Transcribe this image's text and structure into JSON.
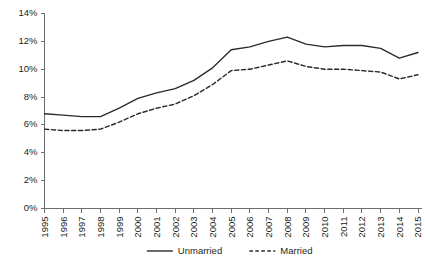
{
  "chart_data": {
    "type": "line",
    "title": "",
    "subtitle": "",
    "xlabel": "",
    "ylabel": "",
    "grid": false,
    "legend_position": "bottom-center",
    "ylim": [
      0,
      14
    ],
    "ytick_labels": [
      "0%",
      "2%",
      "4%",
      "6%",
      "8%",
      "10%",
      "12%",
      "14%"
    ],
    "ytick_values": [
      0,
      2,
      4,
      6,
      8,
      10,
      12,
      14
    ],
    "categories": [
      "1995",
      "1996",
      "1997",
      "1998",
      "1999",
      "2000",
      "2001",
      "2002",
      "2003",
      "2004",
      "2005",
      "2006",
      "2007",
      "2008",
      "2009",
      "2010",
      "2011",
      "2012",
      "2013",
      "2014",
      "2015"
    ],
    "series": [
      {
        "name": "Unmarried",
        "style": "solid",
        "color": "#2b2b2b",
        "values": [
          6.8,
          6.7,
          6.6,
          6.6,
          7.2,
          7.9,
          8.3,
          8.6,
          9.2,
          10.1,
          11.4,
          11.6,
          12.0,
          12.3,
          11.8,
          11.6,
          11.7,
          11.7,
          11.5,
          10.8,
          11.2
        ]
      },
      {
        "name": "Married",
        "style": "dashed",
        "color": "#2b2b2b",
        "values": [
          5.7,
          5.6,
          5.6,
          5.7,
          6.2,
          6.8,
          7.2,
          7.5,
          8.1,
          8.9,
          9.9,
          10.0,
          10.3,
          10.6,
          10.2,
          10.0,
          10.0,
          9.9,
          9.8,
          9.3,
          9.6
        ]
      }
    ]
  },
  "legend": {
    "items": [
      {
        "label": "Unmarried",
        "style": "solid"
      },
      {
        "label": "Married",
        "style": "dashed"
      }
    ]
  }
}
